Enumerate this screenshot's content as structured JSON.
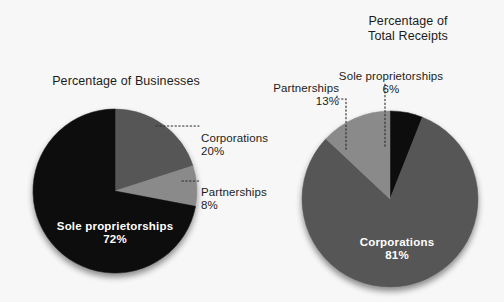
{
  "figure": {
    "background_color": "#f7f7f7",
    "text_color": "#1c1c1c",
    "label_text_color": "#ffffff"
  },
  "charts": {
    "left": {
      "title": "Percentage of Businesses",
      "center_x": 115,
      "center_y": 191,
      "radius": 82,
      "start_angle_deg": -90,
      "slices": [
        {
          "label": "Corporations",
          "value": 20,
          "value_text": "20%",
          "color": "#565656"
        },
        {
          "label": "Partnerships",
          "value": 8,
          "value_text": "8%",
          "color": "#8a8a8a"
        },
        {
          "label": "Sole proprietorships",
          "value": 72,
          "value_text": "72%",
          "color": "#0c0c0c"
        }
      ],
      "callouts": [
        {
          "name": "corporations",
          "label": "Percentage of Businesses\u0000",
          "text": "Corporations",
          "value_text": "20%"
        },
        {
          "name": "partnerships",
          "text": "Partnerships",
          "value_text": "8%"
        }
      ],
      "inner_label": {
        "text": "Sole proprietorships",
        "value_text": "72%"
      }
    },
    "right": {
      "title": "Percentage of\nTotal Receipts",
      "center_x": 390,
      "center_y": 199,
      "radius": 88,
      "start_angle_deg": -90,
      "slices": [
        {
          "label": "Sole proprietorships",
          "value": 6,
          "value_text": "6%",
          "color": "#0c0c0c"
        },
        {
          "label": "Corporations",
          "value": 81,
          "value_text": "81%",
          "color": "#565656"
        },
        {
          "label": "Partnerships",
          "value": 13,
          "value_text": "13%",
          "color": "#8a8a8a"
        }
      ],
      "callouts": [
        {
          "name": "partnerships",
          "text": "Partnerships",
          "value_text": "13%"
        },
        {
          "name": "sole-proprietorships",
          "text": "Sole proprietorships",
          "value_text": "6%"
        }
      ],
      "inner_label": {
        "text": "Corporations",
        "value_text": "81%"
      }
    }
  },
  "labels": {
    "left_title": "Percentage of Businesses",
    "right_title": "Percentage of\nTotal Receipts",
    "left_corporations": "Corporations",
    "left_corporations_pct": "20%",
    "left_partnerships": "Partnerships",
    "left_partnerships_pct": "8%",
    "left_sole": "Sole proprietorships",
    "left_sole_pct": "72%",
    "right_partnerships": "Partnerships",
    "right_partnerships_pct": "13%",
    "right_sole": "Sole proprietorships",
    "right_sole_pct": "6%",
    "right_corporations": "Corporations",
    "right_corporations_pct": "81%"
  },
  "chart_data": [
    {
      "type": "pie",
      "title": "Percentage of Businesses",
      "categories": [
        "Sole proprietorships",
        "Corporations",
        "Partnerships"
      ],
      "values": [
        72,
        20,
        8
      ],
      "value_labels": [
        "72%",
        "20%",
        "8%"
      ],
      "colors": [
        "#0c0c0c",
        "#565656",
        "#8a8a8a"
      ],
      "units": "percent",
      "legend": "none",
      "grid": false,
      "annotations": [
        "Sole proprietorships 72%",
        "Corporations 20%",
        "Partnerships 8%"
      ]
    },
    {
      "type": "pie",
      "title": "Percentage of Total Receipts",
      "categories": [
        "Corporations",
        "Partnerships",
        "Sole proprietorships"
      ],
      "values": [
        81,
        13,
        6
      ],
      "value_labels": [
        "81%",
        "13%",
        "6%"
      ],
      "colors": [
        "#565656",
        "#8a8a8a",
        "#0c0c0c"
      ],
      "units": "percent",
      "legend": "none",
      "grid": false,
      "annotations": [
        "Corporations 81%",
        "Partnerships 13%",
        "Sole proprietorships 6%"
      ]
    }
  ]
}
